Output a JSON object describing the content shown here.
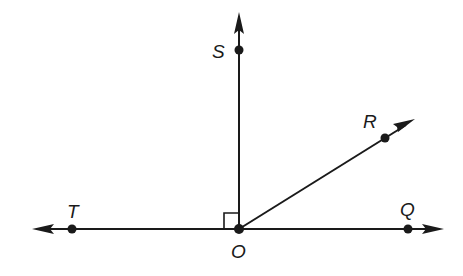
{
  "diagram": {
    "type": "geometry-angles",
    "origin": {
      "label": "O",
      "x": 239,
      "y": 229
    },
    "points": [
      {
        "id": "S",
        "label": "S",
        "x": 239,
        "y": 50,
        "label_x": 212,
        "label_y": 58
      },
      {
        "id": "R",
        "label": "R",
        "x": 385,
        "y": 138,
        "label_x": 363,
        "label_y": 128
      },
      {
        "id": "T",
        "label": "T",
        "x": 72,
        "y": 229,
        "label_x": 67,
        "label_y": 218
      },
      {
        "id": "Q",
        "label": "Q",
        "x": 408,
        "y": 229,
        "label_x": 400,
        "label_y": 216
      },
      {
        "id": "O",
        "label": "O",
        "x": 239,
        "y": 229,
        "label_x": 231,
        "label_y": 258
      }
    ],
    "rays": [
      {
        "name": "ray-OS",
        "from": "O",
        "to": "S",
        "arrow_tip": [
          239,
          12
        ]
      },
      {
        "name": "ray-OR",
        "from": "O",
        "to": "R",
        "arrow_tip": [
          415,
          119
        ]
      },
      {
        "name": "ray-OT",
        "from": "O",
        "to": "T",
        "arrow_tip": [
          32,
          229
        ]
      },
      {
        "name": "ray-OQ",
        "from": "O",
        "to": "Q",
        "arrow_tip": [
          444,
          229
        ]
      }
    ],
    "right_angle_marker": {
      "at": "O",
      "between": [
        "S",
        "T"
      ]
    },
    "color": "#1a1a1a"
  },
  "labels": {
    "S": "S",
    "R": "R",
    "T": "T",
    "Q": "Q",
    "O": "O"
  }
}
